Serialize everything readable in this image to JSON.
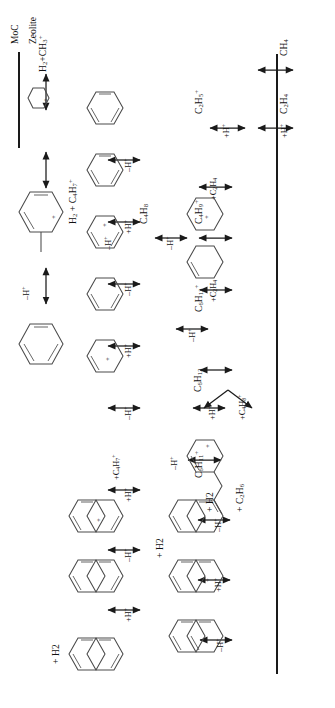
{
  "figure": {
    "type": "reaction-scheme",
    "orientation": "rotated-90-ccw"
  },
  "catalysts": {
    "left_label": "MoC",
    "right_label": "Zeolite"
  },
  "species": {
    "ch4": "CH4",
    "c2h4": "C2H4",
    "c2h5_cat": "C2H5+",
    "c4h9_cat": "C4H9+",
    "c4h8": "C4H8",
    "h2_c4h7_cat": "H2 + C4H7+",
    "c6h13_cat": "C6H13+",
    "c6h12": "C6H12",
    "c6h11_cat": "C6H11+",
    "h2_ch3_cat": "H2+CH3+"
  },
  "reagents": {
    "plus_h_1": "+H+",
    "plus_h_2": "+H+",
    "plus_c2h4_1": "+C2H4",
    "plus_c2h4_2": "+C2H4",
    "minus_h_c4": "-H+",
    "minus_h_c4h7": "-H+",
    "minus_h_c6h13": "-H+",
    "branch_plus_h": "+H+",
    "branch_plus_c4h8": "+C4H8+",
    "minus_h_c6h11": "-H+",
    "products_h2": "+ H2",
    "products_c2h6": "+ C2H6"
  },
  "middle_column": {
    "a_minus_h": "-H+",
    "b_plus_h": "+H+",
    "c_minus_h": "-H+",
    "d_plus_h": "+H+",
    "e_minus_h": "-H+",
    "f_plus_c4h7": "+C4H7+"
  },
  "right_column": {
    "a_plus_h": "+H+",
    "b_minus_h": "-H+",
    "c_plus_h": "+H+",
    "d_minus_h": "-H+",
    "e_plus_h": "+H+",
    "f_minus_h": "-H+",
    "g_plus_h2_mid": "+ H2",
    "h_plus_h2_top": "+ H2"
  },
  "bottom_row": {
    "minus_h": "-H+"
  },
  "colors": {
    "ink": "#1a1a1a",
    "ring_stroke": "#4a4a4a",
    "background": "#ffffff"
  }
}
